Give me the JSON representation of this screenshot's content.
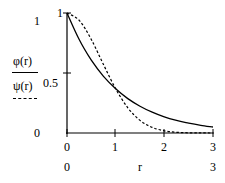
{
  "chart_data": {
    "type": "line",
    "title": "",
    "xlabel": "r",
    "ylabel": "φ(r) / ψ(r)",
    "xlim": [
      0,
      3
    ],
    "ylim": [
      0,
      1
    ],
    "grid": false,
    "x_ticks": [
      "0",
      "1",
      "2",
      "3"
    ],
    "y_ticks": [
      "0",
      "0.5",
      "1"
    ],
    "range_labels": {
      "y_top": "1",
      "y_bottom": "0",
      "x_left": "0",
      "x_right": "3"
    },
    "x": [
      0,
      0.25,
      0.5,
      0.75,
      1.0,
      1.25,
      1.5,
      1.75,
      2.0,
      2.25,
      2.5,
      2.75,
      3.0
    ],
    "series": [
      {
        "name": "φ(r)",
        "style": "solid",
        "values": [
          1.0,
          0.779,
          0.607,
          0.472,
          0.368,
          0.287,
          0.223,
          0.174,
          0.135,
          0.105,
          0.082,
          0.064,
          0.05
        ]
      },
      {
        "name": "ψ(r)",
        "style": "dashed",
        "values": [
          1.0,
          0.939,
          0.779,
          0.57,
          0.368,
          0.21,
          0.105,
          0.047,
          0.018,
          0.006,
          0.002,
          0.001,
          0.0001
        ]
      }
    ],
    "legend": {
      "position": "left",
      "entries": [
        "φ(r)",
        "ψ(r)"
      ]
    }
  },
  "labels": {
    "y_top": "1",
    "y_bottom": "0",
    "y_tick_1": "1",
    "y_tick_05": "0.5",
    "y_tick_0": "0",
    "x_tick_0": "0",
    "x_tick_1": "1",
    "x_tick_2": "2",
    "x_tick_3": "3",
    "x_min": "0",
    "x_max": "3",
    "xlabel": "r",
    "legend_phi": "φ(r)",
    "legend_psi": "ψ(r)"
  }
}
